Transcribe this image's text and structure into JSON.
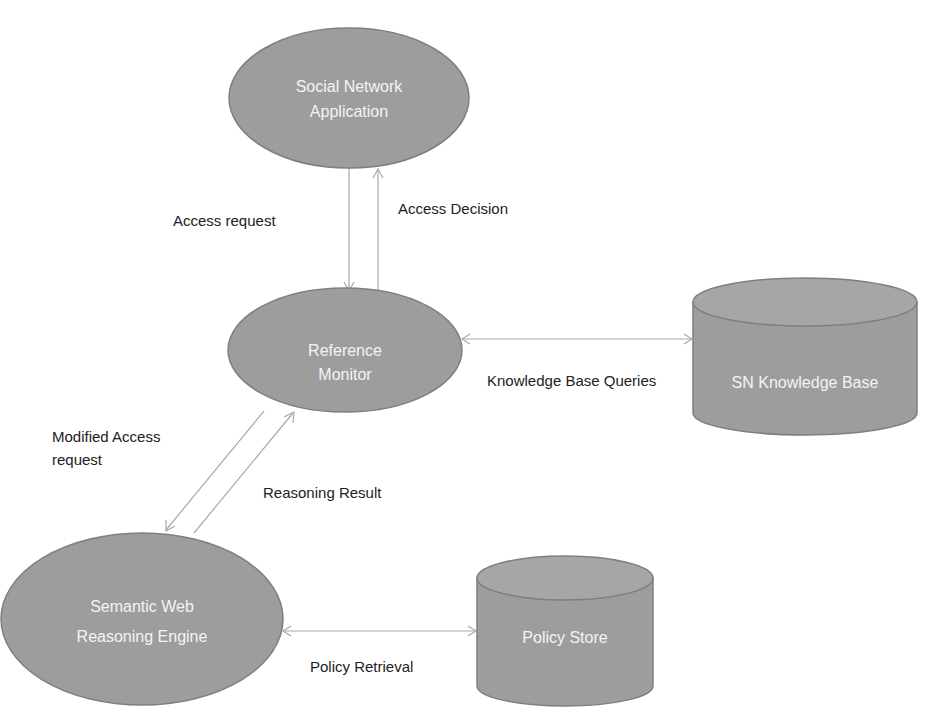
{
  "diagram": {
    "colors": {
      "node_fill": "#9d9d9d",
      "node_stroke": "#7f7f7f",
      "node_text": "#f4f4f4",
      "edge": "#a9a9a9",
      "edge_label_text": "#222222",
      "background": "#ffffff"
    },
    "nodes": [
      {
        "id": "social-network-application",
        "shape": "ellipse",
        "lines": [
          "Social Network",
          "Application"
        ]
      },
      {
        "id": "reference-monitor",
        "shape": "ellipse",
        "lines": [
          "Reference",
          "Monitor"
        ]
      },
      {
        "id": "sn-knowledge-base",
        "shape": "cylinder",
        "lines": [
          "SN Knowledge Base"
        ]
      },
      {
        "id": "semantic-web-reasoning-engine",
        "shape": "ellipse",
        "lines": [
          "Semantic Web",
          "Reasoning Engine"
        ]
      },
      {
        "id": "policy-store",
        "shape": "cylinder",
        "lines": [
          "Policy Store"
        ]
      }
    ],
    "edges": [
      {
        "from": "social-network-application",
        "to": "reference-monitor",
        "label_lines": [
          "Access request"
        ]
      },
      {
        "from": "reference-monitor",
        "to": "social-network-application",
        "label_lines": [
          "Access Decision"
        ]
      },
      {
        "from": "reference-monitor",
        "to": "sn-knowledge-base",
        "label_lines": [
          "Knowledge Base Queries"
        ],
        "bidirectional": true
      },
      {
        "from": "reference-monitor",
        "to": "semantic-web-reasoning-engine",
        "label_lines": [
          "Modified Access",
          "request"
        ]
      },
      {
        "from": "semantic-web-reasoning-engine",
        "to": "reference-monitor",
        "label_lines": [
          "Reasoning Result"
        ]
      },
      {
        "from": "semantic-web-reasoning-engine",
        "to": "policy-store",
        "label_lines": [
          "Policy Retrieval"
        ],
        "bidirectional": true
      }
    ]
  }
}
